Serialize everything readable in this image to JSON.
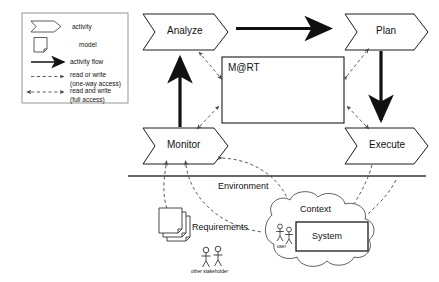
{
  "diagram": {
    "legend": {
      "items": [
        {
          "key": "activity",
          "label": "activity",
          "sublabel": "",
          "icon": "chevron-arrow-shape"
        },
        {
          "key": "model",
          "label": "model",
          "sublabel": "",
          "icon": "document-shape"
        },
        {
          "key": "flow",
          "label": "activity flow",
          "sublabel": "",
          "icon": "solid-arrow-right-icon"
        },
        {
          "key": "oneway",
          "label": "read or write",
          "sublabel": "(one-way access)",
          "icon": "dashed-arrow-right-icon"
        },
        {
          "key": "fullacc",
          "label": "read and write",
          "sublabel": "(full access)",
          "icon": "dashed-double-arrow-icon"
        }
      ]
    },
    "activities": [
      {
        "id": "analyze",
        "label": "Analyze"
      },
      {
        "id": "plan",
        "label": "Plan"
      },
      {
        "id": "monitor",
        "label": "Monitor"
      },
      {
        "id": "execute",
        "label": "Execute"
      }
    ],
    "model_box": {
      "label": "M@RT"
    },
    "divider": {
      "label": "Environment"
    },
    "artifacts": [
      {
        "id": "requirements",
        "label": "Requirements",
        "shape": "document-stack"
      },
      {
        "id": "context",
        "label": "Context",
        "shape": "cloud"
      },
      {
        "id": "system",
        "label": "System",
        "shape": "rectangle"
      }
    ],
    "actors": [
      {
        "id": "user",
        "label": "user"
      },
      {
        "id": "other-stakeholder",
        "label": "other stakeholder"
      }
    ],
    "flows": [
      {
        "from": "analyze",
        "to": "plan",
        "type": "activity-flow"
      },
      {
        "from": "plan",
        "to": "execute",
        "type": "activity-flow"
      },
      {
        "from": "monitor",
        "to": "analyze",
        "type": "activity-flow"
      }
    ],
    "accesses": [
      {
        "from": "analyze",
        "to": "model_box",
        "type": "read-or-write"
      },
      {
        "from": "plan",
        "to": "model_box",
        "type": "read-or-write"
      },
      {
        "from": "monitor",
        "to": "model_box",
        "type": "read-or-write"
      },
      {
        "from": "execute",
        "to": "model_box",
        "type": "read-or-write"
      },
      {
        "from": "monitor",
        "to": "requirements",
        "type": "read-or-write"
      },
      {
        "from": "monitor",
        "to": "context",
        "type": "read-or-write"
      },
      {
        "from": "execute",
        "to": "system",
        "type": "read-or-write"
      }
    ],
    "colors": {
      "stroke": "#1a1a1a",
      "fill": "#ffffff",
      "dashed": "#4a4a4a",
      "divider": "#333333"
    }
  }
}
